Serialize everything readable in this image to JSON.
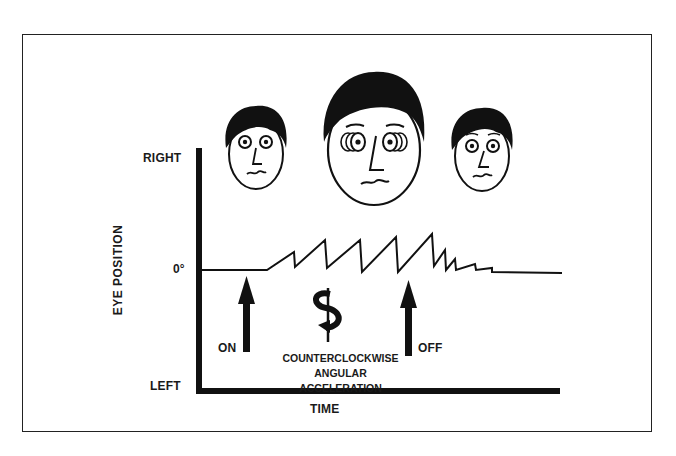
{
  "diagram": {
    "title": "",
    "y_axis": {
      "label": "EYE POSITION",
      "ticks": {
        "top": "RIGHT",
        "middle": "0°",
        "bottom": "LEFT"
      }
    },
    "x_axis": {
      "label": "TIME"
    },
    "markers": [
      {
        "label": "ON",
        "icon": "up-arrow"
      },
      {
        "label": "OFF",
        "icon": "up-arrow"
      }
    ],
    "stimulus": {
      "icon": "counterclockwise-rotation-arrow",
      "caption_line1": "COUNTERCLOCKWISE",
      "caption_line2": "ANGULAR ACCELERATION"
    },
    "faces": [
      {
        "name": "face-before-rotation",
        "expression": "eyes centered, worried"
      },
      {
        "name": "face-during-rotation",
        "expression": "eyes beating (nystagmus), worried"
      },
      {
        "name": "face-after-rotation",
        "expression": "eyes centered, worried"
      }
    ],
    "trace": {
      "description": "Eye position vs time: baseline, sawtooth nystagmus during counterclockwise acceleration, decaying after stimulus off, returning to baseline"
    }
  }
}
